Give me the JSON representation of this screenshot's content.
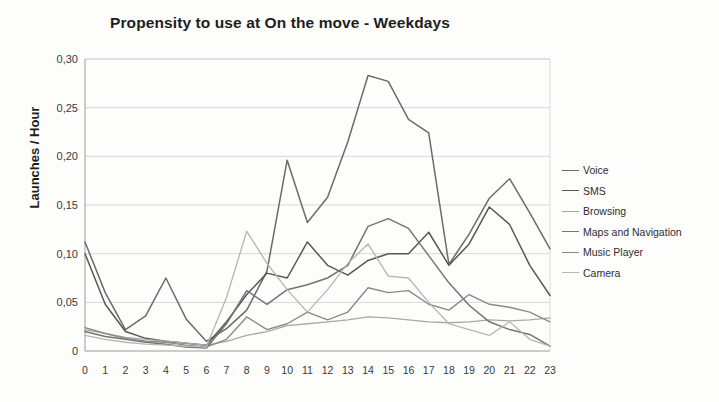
{
  "chart_data": {
    "type": "line",
    "title": "Propensity to use at On the move - Weekdays",
    "xlabel": "",
    "ylabel": "Launches / Hour",
    "x": [
      0,
      1,
      2,
      3,
      4,
      5,
      6,
      7,
      8,
      9,
      10,
      11,
      12,
      13,
      14,
      15,
      16,
      17,
      18,
      19,
      20,
      21,
      22,
      23
    ],
    "xtick_labels": [
      "0",
      "1",
      "2",
      "3",
      "4",
      "5",
      "6",
      "7",
      "8",
      "9",
      "10",
      "11",
      "12",
      "13",
      "14",
      "15",
      "16",
      "17",
      "18",
      "19",
      "20",
      "21",
      "22",
      "23"
    ],
    "ytick_labels": [
      "0",
      "0,05",
      "0,10",
      "0,15",
      "0,20",
      "0,25",
      "0,30"
    ],
    "ytick_values": [
      0,
      0.05,
      0.1,
      0.15,
      0.2,
      0.25,
      0.3
    ],
    "ylim": [
      0,
      0.3
    ],
    "xlim": [
      0,
      23
    ],
    "grid": "horizontal",
    "legend_position": "right",
    "series": [
      {
        "name": "Voice",
        "color": "#6b6b6b",
        "width": 1.5,
        "values": [
          0.112,
          0.06,
          0.022,
          0.036,
          0.075,
          0.033,
          0.01,
          0.023,
          0.042,
          0.082,
          0.196,
          0.132,
          0.158,
          0.215,
          0.283,
          0.277,
          0.238,
          0.224,
          0.089,
          0.12,
          0.157,
          0.177,
          0.142,
          0.105
        ]
      },
      {
        "name": "SMS",
        "color": "#585858",
        "width": 1.5,
        "values": [
          0.1,
          0.048,
          0.02,
          0.013,
          0.01,
          0.008,
          0.006,
          0.03,
          0.058,
          0.08,
          0.075,
          0.112,
          0.088,
          0.078,
          0.093,
          0.1,
          0.1,
          0.122,
          0.088,
          0.11,
          0.148,
          0.13,
          0.088,
          0.057
        ]
      },
      {
        "name": "Browsing",
        "color": "#a8a8a8",
        "width": 1.3,
        "values": [
          0.022,
          0.018,
          0.014,
          0.012,
          0.01,
          0.008,
          0.006,
          0.01,
          0.016,
          0.02,
          0.026,
          0.028,
          0.03,
          0.032,
          0.035,
          0.034,
          0.032,
          0.03,
          0.029,
          0.03,
          0.032,
          0.031,
          0.032,
          0.034
        ]
      },
      {
        "name": "Maps and Navigation",
        "color": "#747474",
        "width": 1.5,
        "values": [
          0.02,
          0.015,
          0.012,
          0.009,
          0.007,
          0.004,
          0.003,
          0.028,
          0.062,
          0.048,
          0.063,
          0.068,
          0.075,
          0.088,
          0.128,
          0.136,
          0.126,
          0.098,
          0.07,
          0.047,
          0.03,
          0.022,
          0.017,
          0.005
        ]
      },
      {
        "name": "Music Player",
        "color": "#8a8a8a",
        "width": 1.4,
        "values": [
          0.024,
          0.018,
          0.013,
          0.01,
          0.009,
          0.006,
          0.004,
          0.012,
          0.035,
          0.022,
          0.028,
          0.04,
          0.032,
          0.04,
          0.065,
          0.06,
          0.062,
          0.048,
          0.042,
          0.058,
          0.048,
          0.045,
          0.04,
          0.03
        ]
      },
      {
        "name": "Camera",
        "color": "#b5b5b5",
        "width": 1.3,
        "values": [
          0.016,
          0.012,
          0.009,
          0.007,
          0.006,
          0.005,
          0.004,
          0.055,
          0.123,
          0.09,
          0.063,
          0.04,
          0.063,
          0.09,
          0.11,
          0.077,
          0.075,
          0.05,
          0.028,
          0.022,
          0.016,
          0.03,
          0.012,
          0.005
        ]
      }
    ]
  },
  "plot": {
    "axis_color": "#9a9a9a",
    "grid_color": "#c9cfd6",
    "background": "#fdfdfc"
  }
}
